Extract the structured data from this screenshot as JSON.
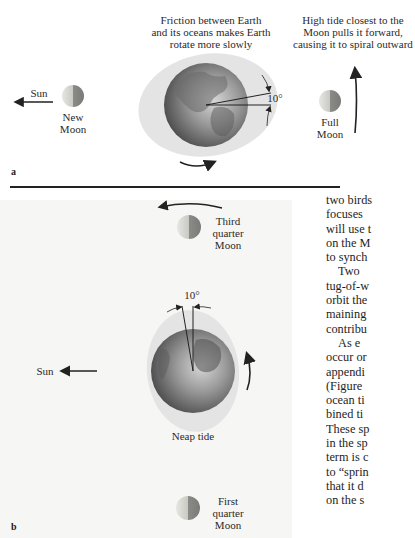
{
  "figure": {
    "panel_a": {
      "letter": "a",
      "caption_friction": [
        "Friction between Earth",
        "and its oceans makes Earth",
        "rotate more slowly"
      ],
      "caption_high_tide": [
        "High tide closest to the",
        "Moon pulls it forward,",
        "causing it to spiral outward"
      ],
      "sun_label": "Sun",
      "new_moon_label": [
        "New",
        "Moon"
      ],
      "full_moon_label": [
        "Full",
        "Moon"
      ],
      "angle_label": "10°"
    },
    "panel_b": {
      "letter": "b",
      "sun_label": "Sun",
      "third_quarter_label": [
        "Third",
        "quarter",
        "Moon"
      ],
      "first_quarter_label": [
        "First",
        "quarter",
        "Moon"
      ],
      "angle_label": "10°",
      "tide_label": "Neap tide"
    }
  },
  "body_text": {
    "lines": [
      "two birds",
      "focuses",
      "will use t",
      "on the M",
      "to synch",
      "Two",
      "tug-of-w",
      "orbit the",
      "maining",
      "contribu",
      "As e",
      "occur or",
      "appendi",
      "(Figure",
      "ocean ti",
      "bined ti",
      "These sp",
      "in the sp",
      "term is c",
      "to “sprin",
      "that it d",
      "on the s"
    ],
    "bold_fragment": "sp",
    "indented_lines": [
      5,
      10
    ]
  },
  "colors": {
    "earth_dark": "#4a4a4a",
    "earth_light": "#c8c8c8",
    "tide_bulge": "#e4e4e4",
    "panel_b_bg": "#f6f6f4",
    "ink": "#222222"
  }
}
